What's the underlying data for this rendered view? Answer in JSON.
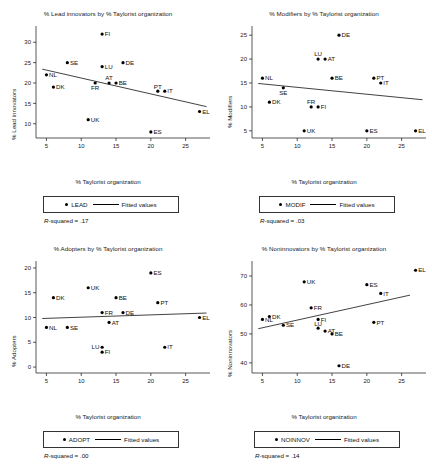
{
  "figure": {
    "panel_count": 4,
    "xlabel": "% Taylorist organization",
    "legend_fitted_label": "Fitted values"
  },
  "panels": [
    {
      "key": "lead",
      "title": "% Lead innovators by % Taylorist organization",
      "ylabel": "% Lead innovators",
      "series_label": "LEAD",
      "rsq_prefix": "R",
      "rsq_text": "-squared = .17",
      "chart_data": {
        "type": "scatter",
        "title": "% Lead innovators by % Taylorist organization",
        "xlabel": "% Taylorist organization",
        "ylabel": "% Lead innovators",
        "xlim": [
          3.5,
          28.5
        ],
        "ylim": [
          6.5,
          33.5
        ],
        "xticks": [
          5,
          10,
          15,
          20,
          25
        ],
        "yticks": [
          10,
          15,
          20,
          25,
          30
        ],
        "grid": false,
        "legend": "bottom",
        "series": [
          {
            "name": "LEAD",
            "points": [
              {
                "label": "NL",
                "x": 5,
                "y": 22,
                "lpos": "right"
              },
              {
                "label": "DK",
                "x": 6,
                "y": 19,
                "lpos": "right"
              },
              {
                "label": "SE",
                "x": 8,
                "y": 25,
                "lpos": "right"
              },
              {
                "label": "UK",
                "x": 11,
                "y": 11,
                "lpos": "right"
              },
              {
                "label": "FR",
                "x": 12,
                "y": 20,
                "lpos": "below"
              },
              {
                "label": "FI",
                "x": 13,
                "y": 32,
                "lpos": "right"
              },
              {
                "label": "LU",
                "x": 13,
                "y": 24,
                "lpos": "right"
              },
              {
                "label": "AT",
                "x": 14,
                "y": 20,
                "lpos": "above"
              },
              {
                "label": "BE",
                "x": 15,
                "y": 20,
                "lpos": "right"
              },
              {
                "label": "DE",
                "x": 16,
                "y": 25,
                "lpos": "right"
              },
              {
                "label": "ES",
                "x": 20,
                "y": 8,
                "lpos": "right"
              },
              {
                "label": "PT",
                "x": 21,
                "y": 18,
                "lpos": "above"
              },
              {
                "label": "IT",
                "x": 22,
                "y": 18,
                "lpos": "right"
              },
              {
                "label": "EL",
                "x": 27,
                "y": 13,
                "lpos": "right"
              }
            ]
          }
        ],
        "fit_line": {
          "name": "Fitted values",
          "x0": 4.4,
          "y0": 23.4,
          "x1": 28.0,
          "y1": 14.2
        },
        "r_squared": 0.17
      }
    },
    {
      "key": "modif",
      "title": "% Modifiers by % Taylorist organization",
      "ylabel": "% Modifiers",
      "series_label": "MODIF",
      "rsq_prefix": "R",
      "rsq_text": "-squared = .03",
      "chart_data": {
        "type": "scatter",
        "title": "% Modifiers by % Taylorist organization",
        "xlabel": "% Taylorist organization",
        "ylabel": "% Modifiers",
        "xlim": [
          3.5,
          28.5
        ],
        "ylim": [
          3.5,
          26.5
        ],
        "xticks": [
          5,
          10,
          15,
          20,
          25
        ],
        "yticks": [
          5,
          10,
          15,
          20,
          25
        ],
        "grid": false,
        "legend": "bottom",
        "series": [
          {
            "name": "MODIF",
            "points": [
              {
                "label": "NL",
                "x": 5,
                "y": 16,
                "lpos": "right"
              },
              {
                "label": "DK",
                "x": 6,
                "y": 11,
                "lpos": "right"
              },
              {
                "label": "SE",
                "x": 8,
                "y": 14,
                "lpos": "below"
              },
              {
                "label": "UK",
                "x": 11,
                "y": 5,
                "lpos": "right"
              },
              {
                "label": "FR",
                "x": 12,
                "y": 10,
                "lpos": "above"
              },
              {
                "label": "LU",
                "x": 13,
                "y": 20,
                "lpos": "above"
              },
              {
                "label": "FI",
                "x": 13,
                "y": 10,
                "lpos": "right"
              },
              {
                "label": "AT",
                "x": 14,
                "y": 20,
                "lpos": "right"
              },
              {
                "label": "BE",
                "x": 15,
                "y": 16,
                "lpos": "right"
              },
              {
                "label": "DE",
                "x": 16,
                "y": 25,
                "lpos": "right"
              },
              {
                "label": "ES",
                "x": 20,
                "y": 5,
                "lpos": "right"
              },
              {
                "label": "PT",
                "x": 21,
                "y": 16,
                "lpos": "right"
              },
              {
                "label": "IT",
                "x": 22,
                "y": 15,
                "lpos": "right"
              },
              {
                "label": "EL",
                "x": 27,
                "y": 5,
                "lpos": "right"
              }
            ]
          }
        ],
        "fit_line": {
          "name": "Fitted values",
          "x0": 4.4,
          "y0": 14.9,
          "x1": 28.0,
          "y1": 11.5
        },
        "r_squared": 0.03
      }
    },
    {
      "key": "adopt",
      "title": "% Adopters by % Taylorist organization",
      "ylabel": "% Adopters",
      "series_label": "ADOPT",
      "rsq_prefix": "R",
      "rsq_text": "-squared = .00",
      "chart_data": {
        "type": "scatter",
        "title": "% Adopters by % Taylorist organization",
        "xlabel": "% Taylorist organization",
        "ylabel": "% Adopters",
        "xlim": [
          3.5,
          28.5
        ],
        "ylim": [
          -1.2,
          21.0
        ],
        "xticks": [
          5,
          10,
          15,
          20,
          25
        ],
        "yticks": [
          0,
          5,
          10,
          15,
          20
        ],
        "grid": false,
        "legend": "bottom",
        "series": [
          {
            "name": "ADOPT",
            "points": [
              {
                "label": "NL",
                "x": 5,
                "y": 8,
                "lpos": "right"
              },
              {
                "label": "DK",
                "x": 6,
                "y": 14,
                "lpos": "right"
              },
              {
                "label": "SE",
                "x": 8,
                "y": 8,
                "lpos": "right"
              },
              {
                "label": "UK",
                "x": 11,
                "y": 16,
                "lpos": "right"
              },
              {
                "label": "FR",
                "x": 13,
                "y": 11,
                "lpos": "right"
              },
              {
                "label": "LU",
                "x": 13,
                "y": 4,
                "lpos": "left"
              },
              {
                "label": "FI",
                "x": 13,
                "y": 3,
                "lpos": "right"
              },
              {
                "label": "AT",
                "x": 14,
                "y": 9,
                "lpos": "right"
              },
              {
                "label": "BE",
                "x": 15,
                "y": 14,
                "lpos": "right"
              },
              {
                "label": "DE",
                "x": 16,
                "y": 11,
                "lpos": "right"
              },
              {
                "label": "ES",
                "x": 20,
                "y": 19,
                "lpos": "right"
              },
              {
                "label": "PT",
                "x": 21,
                "y": 13,
                "lpos": "right"
              },
              {
                "label": "IT",
                "x": 22,
                "y": 4,
                "lpos": "right"
              },
              {
                "label": "EL",
                "x": 27,
                "y": 10,
                "lpos": "right"
              }
            ]
          }
        ],
        "fit_line": {
          "name": "Fitted values",
          "x0": 4.4,
          "y0": 9.8,
          "x1": 28.0,
          "y1": 10.9
        },
        "r_squared": 0.0
      }
    },
    {
      "key": "noinnov",
      "title": "% Noninnovators by % Taylorist organization",
      "ylabel": "% Noninnovators",
      "series_label": "NOINNOV",
      "rsq_prefix": "R",
      "rsq_text": "-squared = .14",
      "chart_data": {
        "type": "scatter",
        "title": "% Noninnovators by % Taylorist organization",
        "xlabel": "% Taylorist organization",
        "ylabel": "% Noninnovators",
        "xlim": [
          3.5,
          28.5
        ],
        "ylim": [
          36.5,
          74.5
        ],
        "xticks": [
          5,
          10,
          15,
          20,
          25
        ],
        "yticks": [
          40,
          50,
          60,
          70
        ],
        "grid": false,
        "legend": "bottom",
        "series": [
          {
            "name": "NOINNOV",
            "points": [
              {
                "label": "NL",
                "x": 5,
                "y": 55,
                "lpos": "right"
              },
              {
                "label": "DK",
                "x": 6,
                "y": 56,
                "lpos": "right"
              },
              {
                "label": "SE",
                "x": 8,
                "y": 53,
                "lpos": "right"
              },
              {
                "label": "UK",
                "x": 11,
                "y": 68,
                "lpos": "right"
              },
              {
                "label": "FR",
                "x": 12,
                "y": 59,
                "lpos": "right"
              },
              {
                "label": "FI",
                "x": 13,
                "y": 55,
                "lpos": "right"
              },
              {
                "label": "LU",
                "x": 13,
                "y": 52,
                "lpos": "above"
              },
              {
                "label": "AT",
                "x": 14,
                "y": 51,
                "lpos": "right"
              },
              {
                "label": "BE",
                "x": 15,
                "y": 50,
                "lpos": "right"
              },
              {
                "label": "DE",
                "x": 16,
                "y": 39,
                "lpos": "right"
              },
              {
                "label": "ES",
                "x": 20,
                "y": 67,
                "lpos": "right"
              },
              {
                "label": "PT",
                "x": 21,
                "y": 54,
                "lpos": "right"
              },
              {
                "label": "IT",
                "x": 22,
                "y": 64,
                "lpos": "right"
              },
              {
                "label": "EL",
                "x": 27,
                "y": 72,
                "lpos": "right"
              }
            ]
          }
        ],
        "fit_line": {
          "name": "Fitted values",
          "x0": 4.4,
          "y0": 51.8,
          "x1": 26.2,
          "y1": 63.4
        },
        "r_squared": 0.14
      }
    }
  ]
}
